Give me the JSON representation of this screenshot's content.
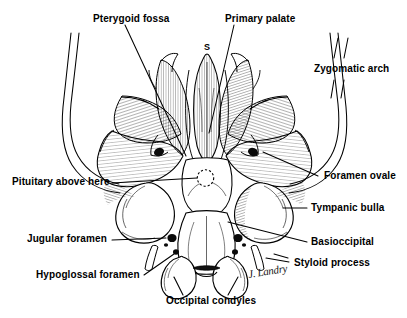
{
  "figure": {
    "background_color": "#ffffff",
    "ink_color": "#000000",
    "signature": "J. Landry"
  },
  "labels": {
    "pterygoid_fossa": "Pterygoid fossa",
    "primary_palate": "Primary palate",
    "zygomatic_arch": "Zygomatic arch",
    "sphenoid_marker": "S",
    "pituitary_above_here": "Pituitary above here",
    "foramen_ovale": "Foramen ovale",
    "tympanic_bulla": "Tympanic bulla",
    "jugular_foramen": "Jugular foramen",
    "basioccipital": "Basioccipital",
    "hypoglossal_foramen": "Hypoglossal foramen",
    "styloid_process": "Styloid process",
    "occipital_condyles": "Occipital condyles"
  }
}
